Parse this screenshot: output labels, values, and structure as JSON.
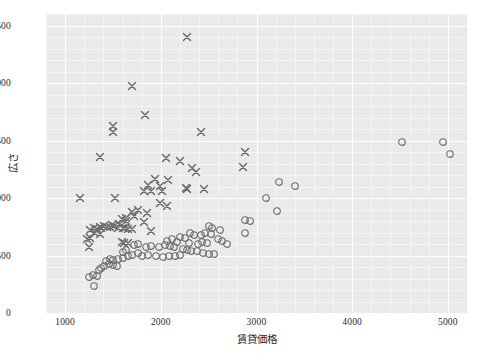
{
  "chart_data": {
    "type": "scatter",
    "title": "",
    "xlabel": "賃貸価格",
    "ylabel": "広さ",
    "xlim": [
      800,
      5200
    ],
    "ylim": [
      0,
      2600
    ],
    "xticks": [
      1000,
      2000,
      3000,
      4000,
      5000
    ],
    "yticks": [
      0,
      500,
      1000,
      1500,
      2000,
      2500
    ],
    "grid": true,
    "legend": "none",
    "background": "#eaeaea",
    "gridcolor": "#ffffff",
    "marker_color": "#6b6b6b",
    "series": [
      {
        "name": "cross-group",
        "marker": "x",
        "points": [
          [
            2270,
            2400
          ],
          [
            1700,
            1975
          ],
          [
            1830,
            1720
          ],
          [
            1500,
            1630
          ],
          [
            1500,
            1575
          ],
          [
            2420,
            1575
          ],
          [
            1360,
            1355
          ],
          [
            2050,
            1345
          ],
          [
            2200,
            1325
          ],
          [
            2330,
            1265
          ],
          [
            2370,
            1230
          ],
          [
            2880,
            1400
          ],
          [
            2860,
            1270
          ],
          [
            1940,
            1165
          ],
          [
            2070,
            1160
          ],
          [
            1870,
            1110
          ],
          [
            1990,
            1105
          ],
          [
            2260,
            1090
          ],
          [
            2270,
            1075
          ],
          [
            2450,
            1075
          ],
          [
            1820,
            1060
          ],
          [
            1900,
            1060
          ],
          [
            2010,
            1065
          ],
          [
            1160,
            1000
          ],
          [
            1520,
            1000
          ],
          [
            1990,
            960
          ],
          [
            2060,
            930
          ],
          [
            1760,
            900
          ],
          [
            1700,
            880
          ],
          [
            1860,
            870
          ],
          [
            1720,
            840
          ],
          [
            1640,
            830
          ],
          [
            1590,
            820
          ],
          [
            1640,
            800
          ],
          [
            1820,
            790
          ],
          [
            1560,
            775
          ],
          [
            1490,
            765
          ],
          [
            1510,
            760
          ],
          [
            1410,
            755
          ],
          [
            1440,
            750
          ],
          [
            1470,
            750
          ],
          [
            1360,
            745
          ],
          [
            1380,
            740
          ],
          [
            1550,
            740
          ],
          [
            1600,
            735
          ],
          [
            1630,
            735
          ],
          [
            1660,
            730
          ],
          [
            1700,
            730
          ],
          [
            1300,
            735
          ],
          [
            1330,
            730
          ],
          [
            1260,
            720
          ],
          [
            1900,
            715
          ],
          [
            1310,
            700
          ],
          [
            1360,
            690
          ],
          [
            1260,
            655
          ],
          [
            1230,
            640
          ],
          [
            1590,
            620
          ],
          [
            1250,
            570
          ],
          [
            1620,
            610
          ],
          [
            1660,
            605
          ]
        ]
      },
      {
        "name": "circle-group",
        "marker": "o",
        "points": [
          [
            4520,
            1490
          ],
          [
            4950,
            1490
          ],
          [
            5020,
            1385
          ],
          [
            3240,
            1135
          ],
          [
            3400,
            1105
          ],
          [
            3100,
            1000
          ],
          [
            3210,
            890
          ],
          [
            2880,
            810
          ],
          [
            2930,
            800
          ],
          [
            2880,
            695
          ],
          [
            2500,
            760
          ],
          [
            2540,
            740
          ],
          [
            2620,
            720
          ],
          [
            2460,
            700
          ],
          [
            2520,
            690
          ],
          [
            2310,
            700
          ],
          [
            2350,
            680
          ],
          [
            2420,
            675
          ],
          [
            2200,
            665
          ],
          [
            2250,
            650
          ],
          [
            2120,
            640
          ],
          [
            2060,
            625
          ],
          [
            2170,
            620
          ],
          [
            2290,
            610
          ],
          [
            2390,
            600
          ],
          [
            2430,
            615
          ],
          [
            2480,
            610
          ],
          [
            2600,
            640
          ],
          [
            2640,
            630
          ],
          [
            2690,
            600
          ],
          [
            2040,
            590
          ],
          [
            2100,
            580
          ],
          [
            2140,
            570
          ],
          [
            1980,
            575
          ],
          [
            1900,
            580
          ],
          [
            1840,
            570
          ],
          [
            2230,
            560
          ],
          [
            2270,
            545
          ],
          [
            2320,
            540
          ],
          [
            2380,
            535
          ],
          [
            2440,
            520
          ],
          [
            2500,
            515
          ],
          [
            2560,
            510
          ],
          [
            2200,
            505
          ],
          [
            2150,
            500
          ],
          [
            2090,
            495
          ],
          [
            2020,
            490
          ],
          [
            1950,
            500
          ],
          [
            1870,
            505
          ],
          [
            1800,
            500
          ],
          [
            1760,
            520
          ],
          [
            1700,
            505
          ],
          [
            1660,
            495
          ],
          [
            1600,
            480
          ],
          [
            1550,
            470
          ],
          [
            1500,
            460
          ],
          [
            1470,
            470
          ],
          [
            1430,
            450
          ],
          [
            1460,
            430
          ],
          [
            1500,
            420
          ],
          [
            1540,
            410
          ],
          [
            1410,
            405
          ],
          [
            1380,
            390
          ],
          [
            1350,
            370
          ],
          [
            1600,
            530
          ],
          [
            1640,
            545
          ],
          [
            1720,
            590
          ],
          [
            1760,
            600
          ],
          [
            1290,
            330
          ],
          [
            1330,
            320
          ],
          [
            1250,
            310
          ],
          [
            1300,
            235
          ]
        ]
      }
    ]
  }
}
